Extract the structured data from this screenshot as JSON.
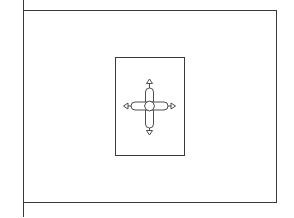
{
  "figure": {
    "description": "Line drawing of a rectangular flag on a pole with a central inset rectangle containing a cross whose arms end in arrowheads",
    "colors": {
      "background": "#ffffff",
      "stroke": "#3a3a3a"
    },
    "pole": {
      "x": 23,
      "y1": 0,
      "y2": 217
    },
    "flag": {
      "x": 23,
      "y": 10,
      "width": 253,
      "height": 192
    },
    "inset": {
      "x": 115,
      "y": 57,
      "width": 69,
      "height": 98
    },
    "cross": {
      "center": [
        149,
        106
      ],
      "arm_length": 19,
      "arm_width": 8,
      "arrow_tips": [
        "up",
        "down",
        "left",
        "right"
      ]
    }
  }
}
